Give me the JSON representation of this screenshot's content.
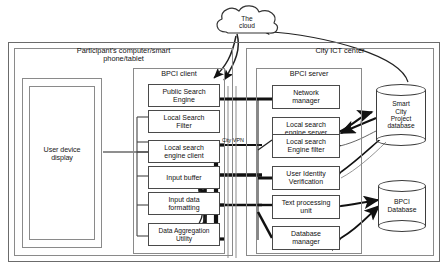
{
  "diagram": {
    "cloud": {
      "label": "The\ncloud"
    },
    "vpn_label": "City VPN",
    "panels": [
      {
        "id": "participant",
        "title": "Participant's computer/smart\nphone/tablet"
      },
      {
        "id": "ict",
        "title": "City ICT center"
      }
    ],
    "subpanels": [
      {
        "id": "bpci-client",
        "title": "BPCI client"
      },
      {
        "id": "bpci-server",
        "title": "BPCI server"
      }
    ],
    "client_display": {
      "label": "User device\ndisplay"
    },
    "client_modules": [
      {
        "id": "public-search-engine",
        "label": "Public Search\nEngine"
      },
      {
        "id": "local-search-filter",
        "label": "Local Search\nFilter"
      },
      {
        "id": "local-search-engine-client",
        "label": "Local search\nengine client"
      },
      {
        "id": "input-buffer",
        "label": "Input buffer"
      },
      {
        "id": "input-data-formatting",
        "label": "Input data\nformatting"
      },
      {
        "id": "data-aggregation-utility",
        "label": "Data Aggregation\nUtility"
      }
    ],
    "server_modules": [
      {
        "id": "network-manager",
        "label": "Network\nmanager"
      },
      {
        "id": "local-search-engine-server",
        "label": "Local search\nengine server"
      },
      {
        "id": "local-search-engine-filter",
        "label": "Local search\nEngine filter"
      },
      {
        "id": "user-identity-verification",
        "label": "User Identity\nVerification"
      },
      {
        "id": "text-processing-unit",
        "label": "Text processing\nunit"
      },
      {
        "id": "database-manager",
        "label": "Database\nmanager"
      }
    ],
    "databases": [
      {
        "id": "smart-city-project-database",
        "label": "Smart\nCity\nProject\ndatabase"
      },
      {
        "id": "bpci-database",
        "label": "BPCI\nDatabase"
      }
    ],
    "colors": {
      "line": "#3d3d3d",
      "frame": "#6b6b6b",
      "bus": "#111111",
      "text": "#111111",
      "background": "#ffffff"
    }
  }
}
